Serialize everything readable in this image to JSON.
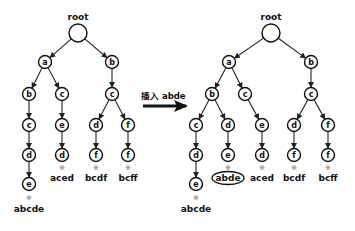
{
  "operation": {
    "label": "插入 abde",
    "arrow": {
      "x1": 143,
      "y1": 106,
      "x2": 186,
      "y2": 106
    }
  },
  "colors": {
    "stroke": "#111111",
    "node_fill": "#ffffff",
    "mark": "#666666"
  },
  "trees": [
    {
      "name": "before",
      "root": {
        "label": "root",
        "x": 78,
        "y": 33,
        "r": 9
      },
      "nodes": [
        {
          "id": "a",
          "ch": "a",
          "x": 45,
          "y": 62,
          "parent": "root"
        },
        {
          "id": "b",
          "ch": "b",
          "x": 112,
          "y": 62,
          "parent": "root"
        },
        {
          "id": "ab",
          "ch": "b",
          "x": 29,
          "y": 94,
          "parent": "a"
        },
        {
          "id": "ac",
          "ch": "c",
          "x": 62,
          "y": 94,
          "parent": "a"
        },
        {
          "id": "bc",
          "ch": "c",
          "x": 112,
          "y": 94,
          "parent": "b"
        },
        {
          "id": "abc",
          "ch": "c",
          "x": 29,
          "y": 125,
          "parent": "ab"
        },
        {
          "id": "ace",
          "ch": "e",
          "x": 62,
          "y": 125,
          "parent": "ac"
        },
        {
          "id": "bcd",
          "ch": "d",
          "x": 96,
          "y": 125,
          "parent": "bc"
        },
        {
          "id": "bcf",
          "ch": "f",
          "x": 128,
          "y": 125,
          "parent": "bc"
        },
        {
          "id": "abcd",
          "ch": "d",
          "x": 29,
          "y": 155,
          "parent": "abc"
        },
        {
          "id": "aced",
          "ch": "d",
          "x": 62,
          "y": 155,
          "parent": "ace"
        },
        {
          "id": "bcdf",
          "ch": "f",
          "x": 96,
          "y": 155,
          "parent": "bcd"
        },
        {
          "id": "bcff",
          "ch": "f",
          "x": 128,
          "y": 155,
          "parent": "bcf"
        },
        {
          "id": "abcde",
          "ch": "e",
          "x": 29,
          "y": 184,
          "parent": "abcd"
        }
      ],
      "words": [
        {
          "text": "aced",
          "x": 62,
          "mark_y": 168,
          "word_y": 181,
          "highlight": false
        },
        {
          "text": "bcdf",
          "x": 96,
          "mark_y": 168,
          "word_y": 181,
          "highlight": false
        },
        {
          "text": "bcff",
          "x": 128,
          "mark_y": 168,
          "word_y": 181,
          "highlight": false
        },
        {
          "text": "abcde",
          "x": 29,
          "mark_y": 198,
          "word_y": 212,
          "highlight": false
        }
      ]
    },
    {
      "name": "after",
      "root": {
        "label": "root",
        "x": 271,
        "y": 33,
        "r": 9
      },
      "nodes": [
        {
          "id": "a",
          "ch": "a",
          "x": 229,
          "y": 62,
          "parent": "root"
        },
        {
          "id": "b",
          "ch": "b",
          "x": 311,
          "y": 62,
          "parent": "root"
        },
        {
          "id": "ab",
          "ch": "b",
          "x": 212,
          "y": 94,
          "parent": "a"
        },
        {
          "id": "ac",
          "ch": "c",
          "x": 245,
          "y": 94,
          "parent": "a"
        },
        {
          "id": "bc",
          "ch": "c",
          "x": 311,
          "y": 94,
          "parent": "b"
        },
        {
          "id": "abc",
          "ch": "c",
          "x": 196,
          "y": 125,
          "parent": "ab"
        },
        {
          "id": "abd",
          "ch": "d",
          "x": 228,
          "y": 125,
          "parent": "ab"
        },
        {
          "id": "ace",
          "ch": "e",
          "x": 262,
          "y": 125,
          "parent": "ac"
        },
        {
          "id": "bcd",
          "ch": "d",
          "x": 294,
          "y": 125,
          "parent": "bc"
        },
        {
          "id": "bcf",
          "ch": "f",
          "x": 328,
          "y": 125,
          "parent": "bc"
        },
        {
          "id": "abcd",
          "ch": "d",
          "x": 196,
          "y": 155,
          "parent": "abc"
        },
        {
          "id": "abde",
          "ch": "e",
          "x": 228,
          "y": 155,
          "parent": "abd"
        },
        {
          "id": "aced",
          "ch": "d",
          "x": 262,
          "y": 155,
          "parent": "ace"
        },
        {
          "id": "bcdf",
          "ch": "f",
          "x": 294,
          "y": 155,
          "parent": "bcd"
        },
        {
          "id": "bcff",
          "ch": "f",
          "x": 328,
          "y": 155,
          "parent": "bcf"
        },
        {
          "id": "abcde",
          "ch": "e",
          "x": 196,
          "y": 184,
          "parent": "abcd"
        }
      ],
      "words": [
        {
          "text": "abde",
          "x": 228,
          "mark_y": 168,
          "word_y": 181,
          "highlight": true
        },
        {
          "text": "aced",
          "x": 262,
          "mark_y": 168,
          "word_y": 181,
          "highlight": false
        },
        {
          "text": "bcdf",
          "x": 294,
          "mark_y": 168,
          "word_y": 181,
          "highlight": false
        },
        {
          "text": "bcff",
          "x": 328,
          "mark_y": 168,
          "word_y": 181,
          "highlight": false
        },
        {
          "text": "abcde",
          "x": 196,
          "mark_y": 198,
          "word_y": 212,
          "highlight": false
        }
      ]
    }
  ],
  "end_marker": "※",
  "node_radius": 6.5
}
